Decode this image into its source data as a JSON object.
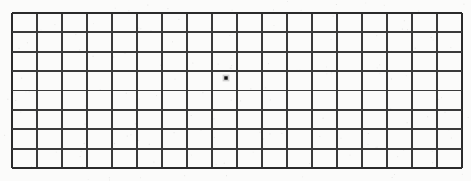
{
  "chart_data": {
    "type": "table",
    "subtitle": "",
    "xlabel": "",
    "ylabel": "",
    "grid": {
      "columns": 18,
      "rows": 8,
      "x_start": 12,
      "y_start": 13,
      "x_end": 462,
      "y_end": 168,
      "cell_width": 25,
      "cell_height": 19.375,
      "line_color": "#3a3a3a",
      "border_color": "#2b2b2b",
      "line_width_px": 2,
      "background_color": "#fbfbfa",
      "vertical_line_x": [
        12,
        37,
        62,
        87,
        112,
        137,
        162,
        187,
        212,
        237,
        262,
        287,
        312,
        337,
        362,
        387,
        412,
        437,
        462
      ],
      "horizontal_line_y": [
        13,
        32.375,
        51.75,
        71.125,
        90.5,
        109.875,
        129.25,
        148.625,
        168
      ]
    },
    "fixation_point": {
      "label": "central fixation dot",
      "x": 226,
      "y": 78,
      "column_index": 8,
      "row_index": 3,
      "size_px": 3.4,
      "color": "#111111",
      "shape": "square"
    },
    "annotations": [],
    "legend": []
  },
  "page": {
    "background_color": "#fbfbfa",
    "width": 471,
    "height": 181
  }
}
